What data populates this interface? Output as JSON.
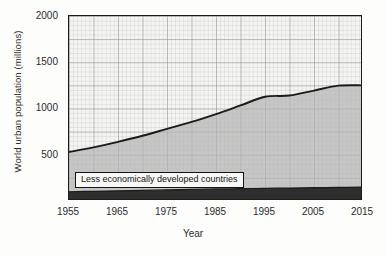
{
  "chart_data": {
    "type": "area",
    "title": "",
    "subtitle": "",
    "xlabel": "Year",
    "ylabel": "World urban population (millions)",
    "xlim": [
      1955,
      2015
    ],
    "ylim": [
      0,
      2000
    ],
    "xticks": [
      1955,
      1965,
      1975,
      1985,
      1995,
      2005,
      2015
    ],
    "yticks": [
      500,
      1000,
      1500,
      2000
    ],
    "grid": true,
    "grid_minor": true,
    "legend_position": "inside-lower-left",
    "stacked": true,
    "x": [
      1955,
      1960,
      1965,
      1970,
      1975,
      1980,
      1985,
      1990,
      1995,
      2000,
      2005,
      2010,
      2015
    ],
    "series": [
      {
        "name": "More economically developed countries",
        "fill": "#2e2e2e",
        "values": [
          100,
          105,
          110,
          115,
          120,
          125,
          130,
          133,
          137,
          140,
          144,
          147,
          150
        ]
      },
      {
        "name": "Less economically developed countries",
        "fill": "#b4b4b4",
        "values": [
          430,
          475,
          530,
          590,
          660,
          730,
          810,
          900,
          990,
          1000,
          1050,
          1100,
          1100
        ]
      }
    ],
    "total": [
      530,
      580,
      640,
      705,
      780,
      855,
      940,
      1033,
      1127,
      1140,
      1194,
      1247,
      1250
    ],
    "annotations": []
  },
  "axes": {
    "y_title": "World urban population (millions)",
    "x_title": "Year",
    "y_ticks": [
      {
        "value": 2000,
        "label": "2000"
      },
      {
        "value": 1500,
        "label": "1500"
      },
      {
        "value": 1000,
        "label": "1000"
      },
      {
        "value": 500,
        "label": "500"
      }
    ],
    "x_ticks": [
      {
        "value": 1955,
        "label": "1955"
      },
      {
        "value": 1965,
        "label": "1965"
      },
      {
        "value": 1975,
        "label": "1975"
      },
      {
        "value": 1985,
        "label": "1985"
      },
      {
        "value": 1995,
        "label": "1995"
      },
      {
        "value": 2005,
        "label": "2005"
      },
      {
        "value": 2015,
        "label": "2015"
      }
    ]
  },
  "legend": {
    "less_label": "Less economically developed countries",
    "more_label": "More economically developed countries"
  },
  "colors": {
    "background": "#fdfdfb",
    "plot_background": "#f4f4f2",
    "axis_line": "#1c1c1c",
    "grid_minor": "#c9c9c7",
    "grid_major": "#8e8e8c",
    "less_fill": "#b4b4b4",
    "more_fill": "#2e2e2e",
    "curve_line": "#1a1a1a",
    "text": "#2b2b2b"
  }
}
